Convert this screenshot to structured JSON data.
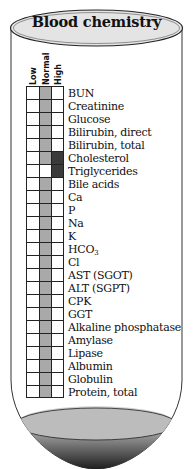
{
  "title": "Blood chemistry",
  "columns": [
    "Low",
    "Normal",
    "High"
  ],
  "colors": {
    "normal_fill": "#a9a9a9",
    "high_fill": "#3a3a3a",
    "cap_fill": "#e4e4e4",
    "blood_dark": "#2a2a2a",
    "blood_light": "#bdbdbd"
  },
  "tests": [
    {
      "name": "BUN",
      "level": "Normal"
    },
    {
      "name": "Creatinine",
      "level": "Normal"
    },
    {
      "name": "Glucose",
      "level": "Normal"
    },
    {
      "name": "Bilirubin, direct",
      "level": "Normal"
    },
    {
      "name": "Bilirubin, total",
      "level": "Normal"
    },
    {
      "name": "Cholesterol",
      "level": "Normal+High"
    },
    {
      "name": "Triglycerides",
      "level": "High"
    },
    {
      "name": "Bile acids",
      "level": "Normal"
    },
    {
      "name": "Ca",
      "level": "Normal"
    },
    {
      "name": "P",
      "level": "Normal"
    },
    {
      "name": "Na",
      "level": "Normal"
    },
    {
      "name": "K",
      "level": "Normal"
    },
    {
      "name": "HCO3",
      "level": "Normal"
    },
    {
      "name": "Cl",
      "level": "Normal"
    },
    {
      "name": "AST (SGOT)",
      "level": "Normal"
    },
    {
      "name": "ALT (SGPT)",
      "level": "Normal"
    },
    {
      "name": "CPK",
      "level": "Normal"
    },
    {
      "name": "GGT",
      "level": "Normal"
    },
    {
      "name": "Alkaline phosphatase",
      "level": "Normal"
    },
    {
      "name": "Amylase",
      "level": "Normal"
    },
    {
      "name": "Lipase",
      "level": "Normal"
    },
    {
      "name": "Albumin",
      "level": "Normal"
    },
    {
      "name": "Globulin",
      "level": "Normal"
    },
    {
      "name": "Protein, total",
      "level": "Normal"
    }
  ]
}
